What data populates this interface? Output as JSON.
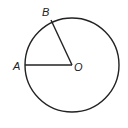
{
  "diagram": {
    "type": "circle-geometry",
    "center_label": "O",
    "points": [
      {
        "label": "A",
        "position": "left on circle"
      },
      {
        "label": "B",
        "position": "upper-left on circle"
      }
    ],
    "segments": [
      "OA",
      "OB"
    ],
    "stroke_color": "#222222",
    "background": "#ffffff"
  }
}
